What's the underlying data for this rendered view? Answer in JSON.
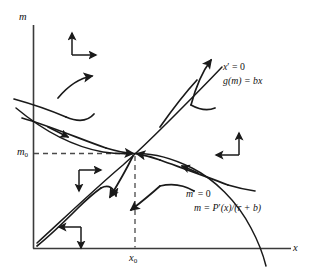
{
  "figure": {
    "type": "phase-plane-diagram",
    "axes": {
      "y_axis_label": "m",
      "x_axis_label": "x",
      "origin_label": "",
      "y_tick_label_base": "m",
      "y_tick_label_sub": "0",
      "x_tick_label_base": "x",
      "x_tick_label_sub": "0"
    },
    "nullclines": [
      {
        "id": "x-nullcline",
        "label_line1_base": "x",
        "label_line1_prime": "′",
        "label_line1_rest": " = 0",
        "label_line2": "g(m) = bx",
        "description": "increasing curve from lower-left to upper-right"
      },
      {
        "id": "m-nullcline",
        "label_line1_base": "m",
        "label_line1_prime": "′",
        "label_line1_rest": " = 0",
        "label_line2_pre": "m = P",
        "label_line2_prime": "′",
        "label_line2_post": "(x)/(r + b)",
        "description": "hump-shaped curve peaking then falling steeply"
      }
    ],
    "equilibrium": {
      "name": "saddle-point",
      "x": "x0",
      "y": "m0"
    },
    "direction_crosses": [
      {
        "id": "top-left",
        "arrows": [
          "up",
          "right"
        ]
      },
      {
        "id": "middle-left",
        "arrows": [
          "right",
          "down"
        ]
      },
      {
        "id": "bottom-left",
        "arrows": [
          "left",
          "down"
        ]
      },
      {
        "id": "right-middle",
        "arrows": [
          "up",
          "left"
        ]
      }
    ],
    "colors": {
      "ink": "#1a1a1a",
      "axis": "#3a3a3a",
      "dashed": "#4a4a4a",
      "background": "#ffffff"
    }
  }
}
